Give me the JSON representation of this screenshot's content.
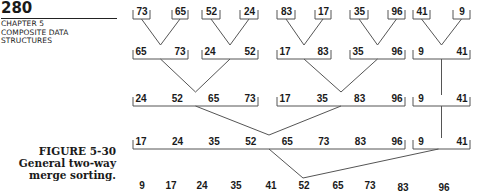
{
  "header": {
    "page_number": "280",
    "chapter_lines": [
      "CHAPTER 5",
      "COMPOSITE DATA",
      "STRUCTURES"
    ]
  },
  "caption": {
    "figure_label": "FIGURE 5-30",
    "lines": [
      "General two-way",
      "merge sorting."
    ]
  },
  "diagram": {
    "levels": [
      {
        "name": "pass-0-input",
        "runs": [
          [
            "73"
          ],
          [
            "65"
          ],
          [
            "52"
          ],
          [
            "24"
          ],
          [
            "83"
          ],
          [
            "17"
          ],
          [
            "35"
          ],
          [
            "96"
          ],
          [
            "41"
          ],
          [
            "9"
          ]
        ]
      },
      {
        "name": "pass-1",
        "runs": [
          [
            "65",
            "73"
          ],
          [
            "24",
            "52"
          ],
          [
            "17",
            "83"
          ],
          [
            "35",
            "96"
          ],
          [
            "9",
            "41"
          ]
        ]
      },
      {
        "name": "pass-2",
        "runs": [
          [
            "24",
            "52",
            "65",
            "73"
          ],
          [
            "17",
            "35",
            "83",
            "96"
          ],
          [
            "9",
            "41"
          ]
        ]
      },
      {
        "name": "pass-3",
        "runs": [
          [
            "17",
            "24",
            "35",
            "52",
            "65",
            "73",
            "83",
            "96"
          ],
          [
            "9",
            "41"
          ]
        ]
      },
      {
        "name": "pass-4-output",
        "runs": [
          [
            "9",
            "17",
            "24",
            "35",
            "41",
            "52",
            "65",
            "73",
            "83",
            "96"
          ]
        ]
      }
    ],
    "line_color": "#555555"
  }
}
